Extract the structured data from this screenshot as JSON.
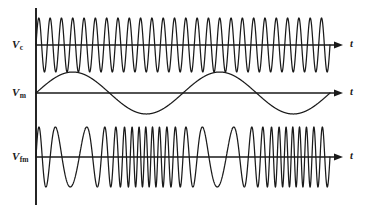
{
  "figure": {
    "background_color": "#ffffff",
    "stroke_color": "#1a1a1a",
    "axis_color": "#1a1a1a"
  },
  "vertical_axis": {
    "name": "shared-vertical-axis",
    "x": 36,
    "y_top": 8,
    "y_bottom": 205
  },
  "panels": [
    {
      "id": "carrier",
      "label": "V",
      "label_subscript": "c",
      "label_full": "Vc",
      "description": "Carrier signal, constant amplitude and constant frequency",
      "axis_label": "t",
      "baseline_y": 45,
      "amplitude": 27,
      "x_start": 36,
      "x_end": 330,
      "arrow_end_x": 340
    },
    {
      "id": "modulating",
      "label": "V",
      "label_subscript": "m",
      "label_full": "Vm",
      "description": "Modulating signal, low frequency sine wave",
      "axis_label": "t",
      "baseline_y": 93,
      "amplitude": 21,
      "x_start": 36,
      "x_end": 330,
      "arrow_end_x": 340
    },
    {
      "id": "fm-output",
      "label": "V",
      "label_subscript": "fm",
      "label_full": "Vfm",
      "description": "Frequency modulated output, constant amplitude and varying frequency",
      "axis_label": "t",
      "baseline_y": 157,
      "amplitude": 30,
      "x_start": 36,
      "x_end": 330,
      "arrow_end_x": 340
    }
  ],
  "chart_data": {
    "type": "line",
    "xlabel": "t",
    "ylabel": "",
    "grid": false,
    "legend": false,
    "series": [
      {
        "name": "Vc",
        "panel": "carrier",
        "waveform": "sine",
        "cycles": 26,
        "amplitude": 1.0,
        "phase": 0,
        "frequency_label": "carrier frequency (constant)"
      },
      {
        "name": "Vm",
        "panel": "modulating",
        "waveform": "sine",
        "cycles": 2,
        "amplitude": 1.0,
        "phase": 0,
        "frequency_label": "modulating frequency (constant, low)"
      },
      {
        "name": "Vfm",
        "panel": "fm-output",
        "waveform": "frequency-modulated-sine",
        "carrier_cycles": 26,
        "modulation_cycles": 2,
        "modulation_index": 9.0,
        "amplitude": 1.0,
        "frequency_label": "instantaneous frequency follows Vm"
      }
    ]
  }
}
